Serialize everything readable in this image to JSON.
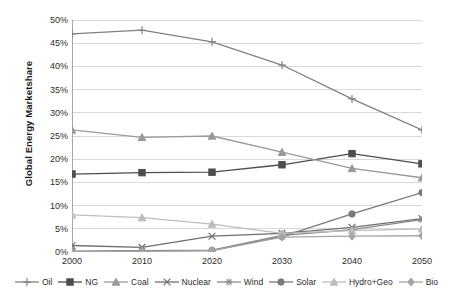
{
  "chart_data": {
    "type": "line",
    "title": "",
    "xlabel": "",
    "ylabel": "Global Energy Marketshare",
    "x": [
      2000,
      2010,
      2020,
      2030,
      2040,
      2050
    ],
    "categories": [
      "2000",
      "2010",
      "2020",
      "2030",
      "2040",
      "2050"
    ],
    "xlim": [
      2000,
      2050
    ],
    "ylim": [
      0,
      50
    ],
    "ytick_labels": [
      "0%",
      "5%",
      "10%",
      "15%",
      "20%",
      "25%",
      "30%",
      "35%",
      "40%",
      "45%",
      "50%"
    ],
    "ytick_values": [
      0,
      5,
      10,
      15,
      20,
      25,
      30,
      35,
      40,
      45,
      50
    ],
    "grid": "horizontal",
    "legend_position": "bottom",
    "value_unit": "%",
    "series": [
      {
        "name": "Oil",
        "marker": "plus",
        "color": "#808080",
        "values": [
          47.0,
          47.8,
          45.3,
          40.3,
          33.0,
          26.3
        ]
      },
      {
        "name": "NG",
        "marker": "square",
        "color": "#4d4d4d",
        "values": [
          16.8,
          17.1,
          17.2,
          18.8,
          21.2,
          19.0
        ]
      },
      {
        "name": "Coal",
        "marker": "triangle",
        "color": "#9a9a9a",
        "values": [
          26.3,
          24.7,
          25.0,
          21.5,
          18.0,
          16.0
        ]
      },
      {
        "name": "Nuclear",
        "marker": "x",
        "color": "#6e6e6e",
        "values": [
          1.4,
          1.0,
          3.4,
          4.0,
          5.3,
          7.2
        ]
      },
      {
        "name": "Wind",
        "marker": "star",
        "color": "#8a8a8a",
        "values": [
          0.2,
          0.3,
          0.4,
          3.6,
          4.8,
          7.0
        ]
      },
      {
        "name": "Solar",
        "marker": "circle",
        "color": "#7a7a7a",
        "values": [
          0.1,
          0.2,
          0.3,
          3.3,
          8.2,
          12.8
        ]
      },
      {
        "name": "Hydro+Geo",
        "marker": "triangle",
        "color": "#bdbdbd",
        "values": [
          8.0,
          7.4,
          6.0,
          4.0,
          4.6,
          5.0
        ]
      },
      {
        "name": "Bio",
        "marker": "diamond",
        "color": "#a5a5a5",
        "values": [
          0.1,
          0.2,
          0.3,
          3.2,
          3.4,
          3.5
        ]
      }
    ]
  },
  "axis": {
    "y_title": "Global Energy Marketshare"
  },
  "legend": {
    "items": [
      {
        "label": "Oil"
      },
      {
        "label": "NG"
      },
      {
        "label": "Coal"
      },
      {
        "label": "Nuclear"
      },
      {
        "label": "Wind"
      },
      {
        "label": "Solar"
      },
      {
        "label": "Hydro+Geo"
      },
      {
        "label": "Bio"
      }
    ]
  },
  "colors": {
    "grid": "#d9d9d9",
    "axis": "#a6a6a6",
    "text": "#2b2b2b",
    "background": "#ffffff"
  }
}
